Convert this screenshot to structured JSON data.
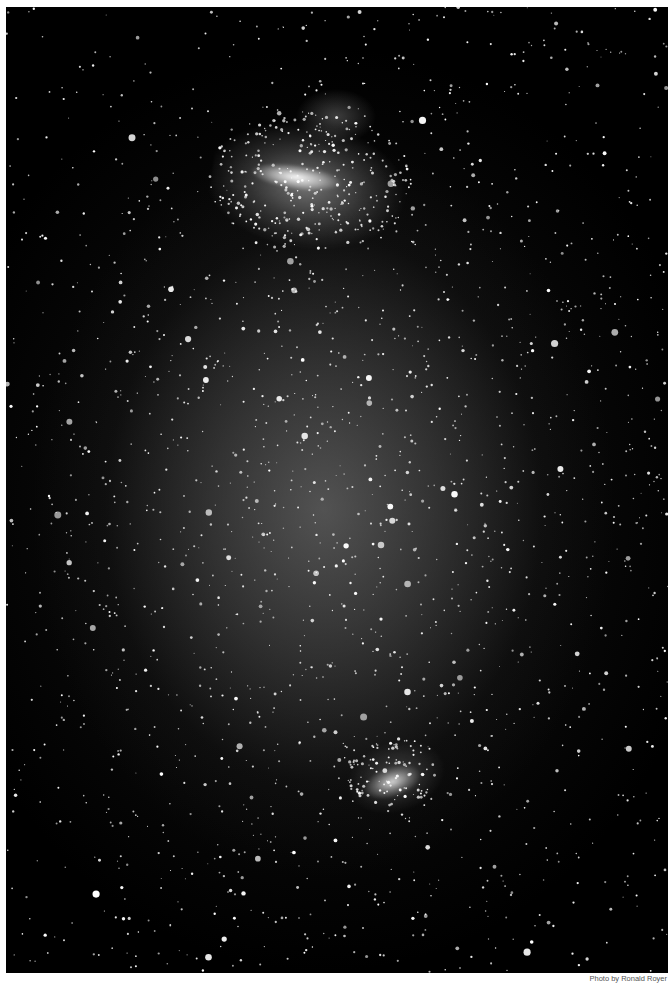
{
  "photo": {
    "subject": "Wide-field night sky photograph showing the Large and Small Magellanic Clouds among dense star field",
    "features": [
      {
        "name": "Large Magellanic Cloud",
        "position": "upper-center"
      },
      {
        "name": "Small Magellanic Cloud",
        "position": "lower-center"
      }
    ],
    "colors": {
      "sky": "#000000",
      "glow": "#787878",
      "border": "#ffffff"
    }
  },
  "caption": {
    "credit": "Photo by Ronald Royer"
  }
}
